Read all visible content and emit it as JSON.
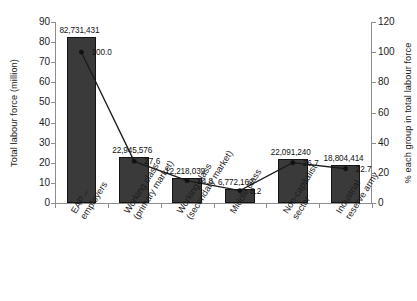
{
  "chart_data": {
    "type": "bar",
    "title": "",
    "subtitle": "",
    "categories": [
      "EAP –\nemployers",
      "Working class\n(primary market)",
      "Working class\n(secondary market)",
      "Middle class",
      "Non-capitalist\nsector",
      "Industrial\nreserve army"
    ],
    "series": [
      {
        "name": "Total labour force (million)",
        "type": "bar",
        "axis": "left",
        "values": [
          82.731431,
          22.945576,
          12.218039,
          6.772162,
          22.09124,
          18.804414
        ],
        "data_labels": [
          "82,731,431",
          "22,945,576",
          "12,218,039",
          "6,772,162",
          "22,091,240",
          "18,804,414"
        ]
      },
      {
        "name": "% each group in total labour force",
        "type": "line",
        "axis": "right",
        "values": [
          100.0,
          27.6,
          14.8,
          8.2,
          26.7,
          22.7
        ],
        "data_labels": [
          "100.0",
          "27.6",
          "14.8",
          "8.2",
          "26.7",
          "22.7"
        ]
      }
    ],
    "xlabel": "",
    "ylabel": "Total labour force (million)",
    "y2label": "% each group in total labour force",
    "ylim": [
      0,
      90
    ],
    "y2lim": [
      0,
      120
    ],
    "yticks": [
      0,
      10,
      20,
      30,
      40,
      50,
      60,
      70,
      80,
      90
    ],
    "y2ticks": [
      0,
      20,
      40,
      60,
      80,
      100,
      120
    ],
    "ytick_labels": [
      "0",
      "10",
      "20",
      "30",
      "40",
      "50",
      "60",
      "70",
      "80",
      "90"
    ],
    "y2tick_labels": [
      "0",
      "20",
      "40",
      "60",
      "80",
      "100",
      "120"
    ],
    "grid": false,
    "legend": "none",
    "colors": {
      "bar_fill": "#3a3a3a",
      "bar_border": "#141414",
      "line": "#1a1a1a",
      "marker": "#111111",
      "axis": "#8d8d8d",
      "text": "#1c1c1c",
      "background": "#ffffff"
    }
  }
}
